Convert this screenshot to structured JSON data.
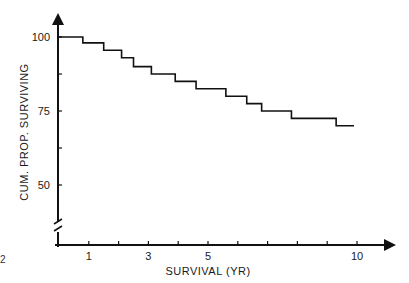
{
  "chart_data": {
    "type": "line",
    "subtype": "step (Kaplan-Meier survival curve)",
    "title": "",
    "xlabel": "SURVIVAL (YR)",
    "ylabel": "CUM. PROP. SURVIVING",
    "xlim": [
      0,
      10.5
    ],
    "ylim": [
      40,
      100
    ],
    "y_axis_break": true,
    "grid": false,
    "legend": null,
    "x_ticks": [
      1,
      2,
      3,
      4,
      5,
      6,
      7,
      8,
      9,
      10
    ],
    "x_tick_labels": [
      "1",
      "",
      "3",
      "",
      "5",
      "",
      "",
      "",
      "",
      "10"
    ],
    "y_ticks": [
      100,
      87.5,
      75,
      62.5,
      50
    ],
    "y_tick_labels": [
      "100",
      "",
      "75",
      "",
      "50"
    ],
    "series": [
      {
        "name": "Cumulative proportion surviving",
        "steps": [
          {
            "x_start": 0.0,
            "x_end": 0.8,
            "y": 100
          },
          {
            "x_start": 0.8,
            "x_end": 1.5,
            "y": 98
          },
          {
            "x_start": 1.5,
            "x_end": 2.1,
            "y": 95.5
          },
          {
            "x_start": 2.1,
            "x_end": 2.5,
            "y": 93
          },
          {
            "x_start": 2.5,
            "x_end": 3.1,
            "y": 90
          },
          {
            "x_start": 3.1,
            "x_end": 3.9,
            "y": 87.5
          },
          {
            "x_start": 3.9,
            "x_end": 4.6,
            "y": 85
          },
          {
            "x_start": 4.6,
            "x_end": 5.6,
            "y": 82.5
          },
          {
            "x_start": 5.6,
            "x_end": 6.3,
            "y": 80
          },
          {
            "x_start": 6.3,
            "x_end": 6.8,
            "y": 77.5
          },
          {
            "x_start": 6.8,
            "x_end": 7.8,
            "y": 75
          },
          {
            "x_start": 7.8,
            "x_end": 9.3,
            "y": 72.5
          },
          {
            "x_start": 9.3,
            "x_end": 9.9,
            "y": 70
          }
        ]
      }
    ]
  },
  "figure": {
    "corner_label": "2"
  }
}
